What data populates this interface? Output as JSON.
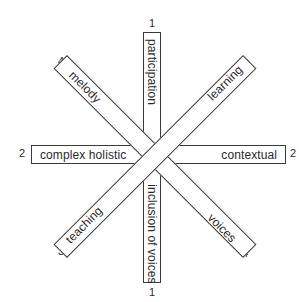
{
  "diagram": {
    "type": "star-of-bars",
    "colors": {
      "stroke": "#3a3a3a",
      "fill": "#ffffff",
      "text": "#2a2a2a"
    },
    "bars": [
      {
        "id": "vertical",
        "orientation": "vertical",
        "label_top": "participation",
        "label_bottom": "inclusion of voices",
        "end_number_top": "1",
        "end_number_bottom": "1"
      },
      {
        "id": "horizontal",
        "orientation": "horizontal",
        "label_left": "complex holistic",
        "label_right": "contextual",
        "end_number_left": "2",
        "end_number_right": "2"
      },
      {
        "id": "diagonal-ne-sw",
        "orientation": "diagonal-rising",
        "label_upper": "learning",
        "label_lower": "teaching",
        "end_number_upper": "3",
        "end_number_lower": "3"
      },
      {
        "id": "diagonal-nw-se",
        "orientation": "diagonal-falling",
        "label_upper": "melody",
        "label_lower": "voices",
        "end_number_upper": "4",
        "end_number_lower": "4"
      }
    ]
  }
}
